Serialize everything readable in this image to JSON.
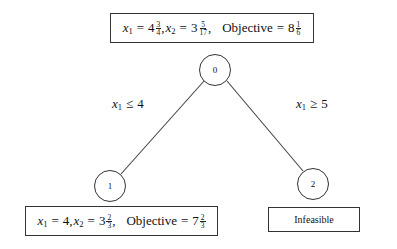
{
  "diagram": {
    "type": "branch-and-bound tree",
    "nodes": [
      {
        "id": "0",
        "label": "0",
        "solution": {
          "x1_var": "x",
          "x1_sub": "1",
          "x1_whole": "4",
          "x1_num": "3",
          "x1_den": "4",
          "x2_var": "x",
          "x2_sub": "2",
          "x2_whole": "3",
          "x2_num": "5",
          "x2_den": "17",
          "objective_label": "Objective",
          "objective_whole": "8",
          "objective_num": "1",
          "objective_den": "6",
          "text": "x1 = 4 3/4, x2 = 3 5/17, Objective = 8 1/6"
        }
      },
      {
        "id": "1",
        "label": "1",
        "solution": {
          "x1_var": "x",
          "x1_sub": "1",
          "x1_value": "4",
          "x2_var": "x",
          "x2_sub": "2",
          "x2_whole": "3",
          "x2_num": "2",
          "x2_den": "3",
          "objective_label": "Objective",
          "objective_whole": "7",
          "objective_num": "2",
          "objective_den": "3",
          "text": "x1 = 4, x2 = 3 2/3, Objective = 7 2/3"
        }
      },
      {
        "id": "2",
        "label": "2",
        "status": "Infeasible"
      }
    ],
    "edges": [
      {
        "from": "0",
        "to": "1",
        "label_var": "x",
        "label_sub": "1",
        "label_op": "≤",
        "label_value": "4",
        "text": "x1 ≤ 4"
      },
      {
        "from": "0",
        "to": "2",
        "label_var": "x",
        "label_sub": "1",
        "label_op": "≥",
        "label_value": "5",
        "text": "x1 ≥ 5"
      }
    ],
    "symbols": {
      "eq": "=",
      "comma": ","
    }
  }
}
